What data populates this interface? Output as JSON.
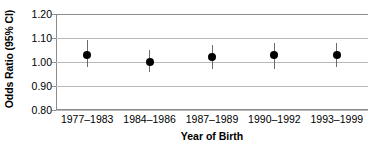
{
  "chart_data": {
    "type": "scatter",
    "title": "",
    "xlabel": "Year of Birth",
    "ylabel": "Odds Ratio (95% CI)",
    "categories": [
      "1977–1983",
      "1984–1986",
      "1987–1989",
      "1990–1992",
      "1993–1999"
    ],
    "values": [
      1.03,
      1.0,
      1.02,
      1.03,
      1.03
    ],
    "ci_lower": [
      0.98,
      0.96,
      0.97,
      0.97,
      0.98
    ],
    "ci_upper": [
      1.09,
      1.05,
      1.07,
      1.08,
      1.08
    ],
    "ylim": [
      0.8,
      1.2
    ],
    "yticks": [
      "0.80",
      "0.90",
      "1.00",
      "1.10",
      "1.20"
    ],
    "ytick_values": [
      0.8,
      0.9,
      1.0,
      1.1,
      1.2
    ],
    "grid": true,
    "legend": "none",
    "marker": "filled-circle",
    "errorbar_style": "plain-vertical-line"
  },
  "axis": {
    "y_title": "Odds Ratio (95% CI)",
    "x_title": "Year of Birth"
  },
  "colors": {
    "marker": "#000000",
    "whisker": "#6a6a6a",
    "gridline": "#b9b9b9",
    "axis": "#8c8c8c",
    "background": "#ffffff",
    "text": "#000000"
  }
}
